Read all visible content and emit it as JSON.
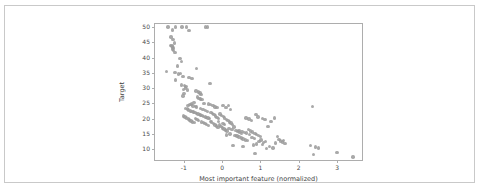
{
  "chart_data": {
    "type": "scatter",
    "title": "",
    "xlabel": "Most important feature (normalized)",
    "ylabel": "Target",
    "xlim": [
      -1.75,
      3.65
    ],
    "ylim": [
      6.5,
      51.0
    ],
    "xticks": [
      -1,
      0,
      1,
      2,
      3
    ],
    "xtick_labels": [
      "-1",
      "0",
      "1",
      "2",
      "3"
    ],
    "yticks": [
      10,
      15,
      20,
      25,
      30,
      35,
      40,
      45,
      50
    ],
    "ytick_labels": [
      "10",
      "15",
      "20",
      "25",
      "30",
      "35",
      "40",
      "45",
      "50"
    ],
    "grid": false,
    "legend": null,
    "marker_color": "#9a9a9a",
    "marker_size": 3.4,
    "marker_opacity": 0.85,
    "series": [
      {
        "name": "samples",
        "points": [
          [
            -1.41,
            50.0
          ],
          [
            -1.21,
            50.0
          ],
          [
            -1.05,
            50.0
          ],
          [
            -0.93,
            50.0
          ],
          [
            -0.44,
            50.0
          ],
          [
            -0.38,
            50.0
          ],
          [
            -1.3,
            49.0
          ],
          [
            -0.86,
            48.8
          ],
          [
            -1.33,
            46.7
          ],
          [
            -1.28,
            46.0
          ],
          [
            -1.24,
            44.8
          ],
          [
            -1.34,
            44.0
          ],
          [
            -1.31,
            43.8
          ],
          [
            -1.29,
            43.5
          ],
          [
            -1.27,
            43.1
          ],
          [
            -1.3,
            42.8
          ],
          [
            -1.26,
            42.3
          ],
          [
            -1.23,
            41.7
          ],
          [
            -1.1,
            39.8
          ],
          [
            -1.06,
            38.7
          ],
          [
            -1.17,
            37.2
          ],
          [
            -0.66,
            36.4
          ],
          [
            -1.45,
            35.4
          ],
          [
            -1.23,
            35.1
          ],
          [
            -1.09,
            34.9
          ],
          [
            -1.13,
            34.7
          ],
          [
            -1.02,
            33.8
          ],
          [
            -0.86,
            33.4
          ],
          [
            -0.79,
            33.2
          ],
          [
            -1.21,
            32.7
          ],
          [
            -0.32,
            31.5
          ],
          [
            -1.06,
            31.0
          ],
          [
            -0.98,
            30.8
          ],
          [
            -0.94,
            30.5
          ],
          [
            -0.96,
            30.1
          ],
          [
            -1.0,
            29.6
          ],
          [
            -0.9,
            29.4
          ],
          [
            -0.68,
            29.1
          ],
          [
            -0.62,
            28.7
          ],
          [
            -0.58,
            28.4
          ],
          [
            -0.55,
            28.0
          ],
          [
            -0.99,
            28.2
          ],
          [
            -1.02,
            27.5
          ],
          [
            -0.64,
            27.1
          ],
          [
            -0.6,
            26.6
          ],
          [
            -0.57,
            26.4
          ],
          [
            -0.52,
            26.2
          ],
          [
            -0.47,
            25.0
          ],
          [
            -0.73,
            25.3
          ],
          [
            -0.8,
            24.8
          ],
          [
            -0.84,
            24.7
          ],
          [
            -0.89,
            24.4
          ],
          [
            -0.76,
            24.2
          ],
          [
            -0.7,
            24.1
          ],
          [
            -0.66,
            23.9
          ],
          [
            -0.36,
            24.8
          ],
          [
            -0.3,
            24.6
          ],
          [
            -0.24,
            24.4
          ],
          [
            -0.18,
            23.9
          ],
          [
            -0.13,
            23.7
          ],
          [
            0.02,
            24.3
          ],
          [
            0.1,
            23.6
          ],
          [
            0.16,
            24.4
          ],
          [
            0.22,
            23.1
          ],
          [
            -0.95,
            23.4
          ],
          [
            -0.91,
            23.2
          ],
          [
            -0.87,
            22.9
          ],
          [
            -0.83,
            22.6
          ],
          [
            -0.78,
            22.4
          ],
          [
            -0.74,
            22.2
          ],
          [
            -0.71,
            22.0
          ],
          [
            -0.67,
            21.8
          ],
          [
            -0.63,
            21.6
          ],
          [
            -0.59,
            21.4
          ],
          [
            -0.56,
            21.2
          ],
          [
            -0.52,
            21.0
          ],
          [
            -0.48,
            20.8
          ],
          [
            -0.44,
            20.6
          ],
          [
            -0.41,
            20.5
          ],
          [
            -0.37,
            20.3
          ],
          [
            -0.33,
            20.1
          ],
          [
            -0.29,
            22.0
          ],
          [
            -0.25,
            21.7
          ],
          [
            -0.21,
            21.3
          ],
          [
            -0.17,
            20.9
          ],
          [
            -0.13,
            20.4
          ],
          [
            -0.09,
            20.0
          ],
          [
            -0.05,
            21.5
          ],
          [
            -0.01,
            21.1
          ],
          [
            0.03,
            20.7
          ],
          [
            0.07,
            20.2
          ],
          [
            0.11,
            19.8
          ],
          [
            0.15,
            19.4
          ],
          [
            0.19,
            19.0
          ],
          [
            0.23,
            18.6
          ],
          [
            0.27,
            18.2
          ],
          [
            -1.01,
            20.9
          ],
          [
            -0.97,
            20.6
          ],
          [
            -0.93,
            20.3
          ],
          [
            -0.88,
            19.9
          ],
          [
            -0.85,
            19.6
          ],
          [
            -0.81,
            19.3
          ],
          [
            -0.77,
            19.0
          ],
          [
            -0.72,
            18.8
          ],
          [
            -0.69,
            20.1
          ],
          [
            -0.65,
            19.7
          ],
          [
            -0.61,
            19.4
          ],
          [
            -0.53,
            19.0
          ],
          [
            -0.49,
            18.7
          ],
          [
            -0.45,
            18.4
          ],
          [
            -0.4,
            18.1
          ],
          [
            -0.35,
            17.8
          ],
          [
            -0.31,
            19.2
          ],
          [
            -0.27,
            18.9
          ],
          [
            -0.22,
            18.5
          ],
          [
            -0.19,
            18.0
          ],
          [
            -0.15,
            17.6
          ],
          [
            -0.11,
            17.2
          ],
          [
            -0.07,
            17.9
          ],
          [
            -0.03,
            17.4
          ],
          [
            0.01,
            17.0
          ],
          [
            0.05,
            16.6
          ],
          [
            0.09,
            16.3
          ],
          [
            0.13,
            16.0
          ],
          [
            0.18,
            16.9
          ],
          [
            0.26,
            16.5
          ],
          [
            0.31,
            17.3
          ],
          [
            0.36,
            16.1
          ],
          [
            0.41,
            15.8
          ],
          [
            0.46,
            15.5
          ],
          [
            0.52,
            15.9
          ],
          [
            0.58,
            15.6
          ],
          [
            0.63,
            15.3
          ],
          [
            0.69,
            16.4
          ],
          [
            0.74,
            16.0
          ],
          [
            0.8,
            15.7
          ],
          [
            0.86,
            15.2
          ],
          [
            0.9,
            14.8
          ],
          [
            0.95,
            14.5
          ],
          [
            1.0,
            14.2
          ],
          [
            0.34,
            14.6
          ],
          [
            0.39,
            14.3
          ],
          [
            0.44,
            14.0
          ],
          [
            0.5,
            13.7
          ],
          [
            0.55,
            13.4
          ],
          [
            0.61,
            13.1
          ],
          [
            0.66,
            12.8
          ],
          [
            0.71,
            14.9
          ],
          [
            0.78,
            13.9
          ],
          [
            0.84,
            13.5
          ],
          [
            0.62,
            20.3
          ],
          [
            0.7,
            19.9
          ],
          [
            0.76,
            19.5
          ],
          [
            0.88,
            21.4
          ],
          [
            0.94,
            20.6
          ],
          [
            1.05,
            20.0
          ],
          [
            1.12,
            19.7
          ],
          [
            1.2,
            17.4
          ],
          [
            1.28,
            19.2
          ],
          [
            1.36,
            20.2
          ],
          [
            1.44,
            14.1
          ],
          [
            1.52,
            12.7
          ],
          [
            1.58,
            12.4
          ],
          [
            1.64,
            11.9
          ],
          [
            1.48,
            13.2
          ],
          [
            1.4,
            12.1
          ],
          [
            1.33,
            10.4
          ],
          [
            1.24,
            11.0
          ],
          [
            1.16,
            10.2
          ],
          [
            1.08,
            12.3
          ],
          [
            1.02,
            13.0
          ],
          [
            0.96,
            12.6
          ],
          [
            0.9,
            11.8
          ],
          [
            0.82,
            11.4
          ],
          [
            0.55,
            10.9
          ],
          [
            0.28,
            11.3
          ],
          [
            0.86,
            8.7
          ],
          [
            2.36,
            24.0
          ],
          [
            2.3,
            11.2
          ],
          [
            2.44,
            10.7
          ],
          [
            2.38,
            8.3
          ],
          [
            2.52,
            10.4
          ],
          [
            3.0,
            9.0
          ],
          [
            3.42,
            7.5
          ],
          [
            -0.44,
            22.7
          ],
          [
            -0.38,
            22.3
          ],
          [
            -0.5,
            23.0
          ],
          [
            -0.56,
            23.3
          ],
          [
            0.02,
            18.4
          ],
          [
            0.06,
            18.1
          ],
          [
            -0.09,
            19.1
          ],
          [
            1.6,
            12.9
          ],
          [
            0.44,
            16.2
          ],
          [
            0.5,
            15.1
          ],
          [
            0.12,
            14.7
          ],
          [
            0.21,
            15.0
          ],
          [
            1.14,
            12.5
          ],
          [
            1.06,
            11.6
          ]
        ]
      }
    ]
  }
}
